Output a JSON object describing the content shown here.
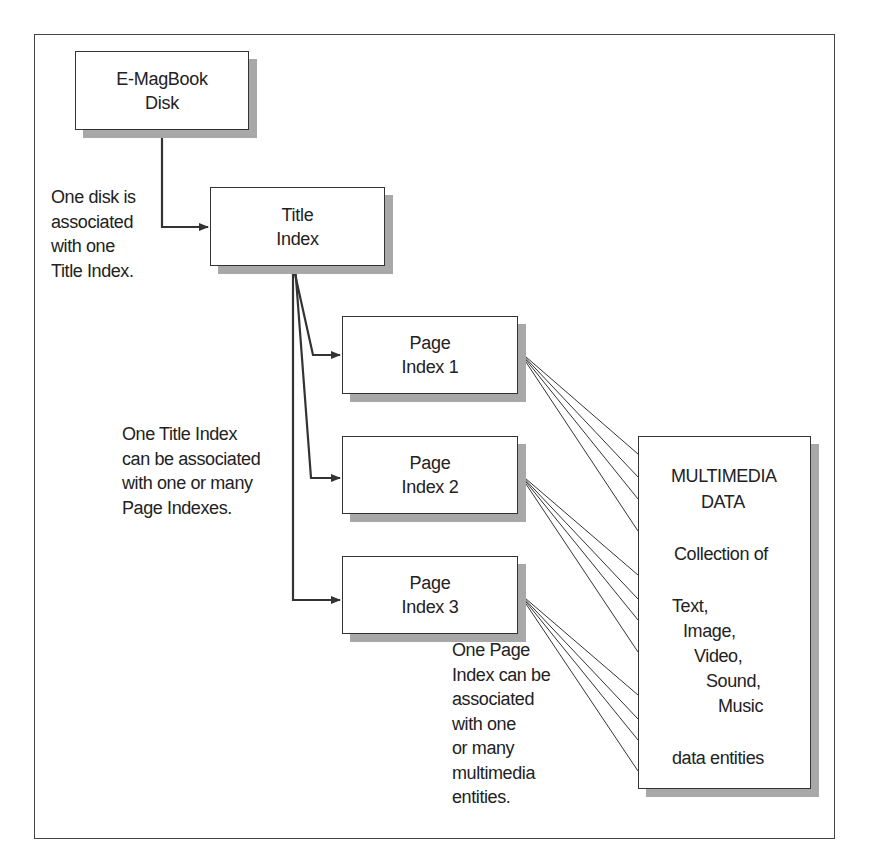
{
  "diagram": {
    "boxes": {
      "disk": {
        "lines": [
          "E-MagBook",
          "Disk"
        ]
      },
      "title_index": {
        "lines": [
          "Title",
          "Index"
        ]
      },
      "page_index_1": {
        "lines": [
          "Page",
          "Index 1"
        ]
      },
      "page_index_2": {
        "lines": [
          "Page",
          "Index 2"
        ]
      },
      "page_index_3": {
        "lines": [
          "Page",
          "Index 3"
        ]
      },
      "multimedia": {
        "title_lines": [
          "MULTIMEDIA",
          "DATA"
        ],
        "subtitle": "Collection of",
        "entities": [
          "Text,",
          "Image,",
          "Video,",
          "Sound,",
          "Music"
        ],
        "footer": "data entities"
      }
    },
    "notes": {
      "disk_to_title": [
        "One disk is",
        "associated",
        "with one",
        "Title Index."
      ],
      "title_to_pages": [
        "One Title Index",
        "can be associated",
        "with one or many",
        "Page Indexes."
      ],
      "page_to_media": [
        "One Page",
        "Index can be",
        "associated",
        "with one",
        "or many",
        "multimedia",
        "entities."
      ]
    },
    "colors": {
      "line": "#333333",
      "shadow": "#a8a8a8",
      "frame": "#444444"
    }
  }
}
